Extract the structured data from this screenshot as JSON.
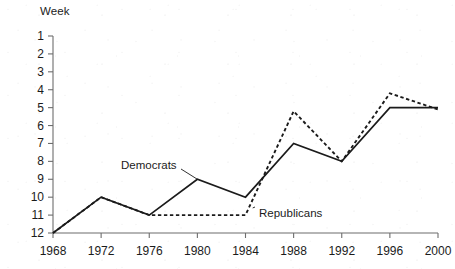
{
  "chart_data": {
    "type": "line",
    "title": "",
    "ylabel": "Week",
    "xlabel": "",
    "x": [
      1968,
      1972,
      1976,
      1980,
      1984,
      1988,
      1992,
      1996,
      2000
    ],
    "xtick_labels": [
      "1968",
      "1972",
      "1976",
      "1980",
      "1984",
      "1988",
      "1992",
      "1996",
      "2000"
    ],
    "ytick_labels": [
      "1",
      "2",
      "3",
      "4",
      "5",
      "6",
      "7",
      "8",
      "9",
      "10",
      "11",
      "12"
    ],
    "ylim": [
      1,
      12
    ],
    "y_inverted": true,
    "grid": false,
    "legend_position": "inline-annotation",
    "series": [
      {
        "name": "Democrats",
        "style": "solid",
        "color": "#1b1b1b",
        "values": [
          12,
          10,
          11,
          9,
          10,
          7,
          8,
          5,
          5
        ]
      },
      {
        "name": "Republicans",
        "style": "dotted",
        "color": "#1b1b1b",
        "values": [
          12,
          10,
          11,
          11,
          11,
          5.2,
          8,
          4.2,
          5.1
        ]
      }
    ],
    "annotations": [
      {
        "text": "Democrats",
        "target_x": 1980,
        "target_y": 9
      },
      {
        "text": "Republicans",
        "target_x": 1984.6,
        "target_y": 10.6
      }
    ]
  }
}
